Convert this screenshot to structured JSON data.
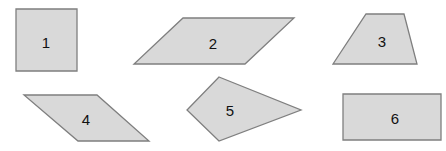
{
  "colors": {
    "fill": "#d9d9d9",
    "stroke": "#7f7f7f",
    "text": "#111111",
    "background": "#ffffff"
  },
  "shapes": [
    {
      "id": 1,
      "label": "1",
      "kind": "square",
      "points": "16,9 77,9 77,71 16,71",
      "label_pos": [
        46,
        41
      ]
    },
    {
      "id": 2,
      "label": "2",
      "kind": "parallelogram",
      "points": "183,18 294,18 245,64 134,64",
      "label_pos": [
        213,
        42
      ]
    },
    {
      "id": 3,
      "label": "3",
      "kind": "trapezoid",
      "points": "366,14 404,14 417,64 333,64",
      "label_pos": [
        382,
        40
      ]
    },
    {
      "id": 4,
      "label": "4",
      "kind": "parallelogram",
      "points": "24,95 97,95 149,141 78,141",
      "label_pos": [
        86,
        118
      ]
    },
    {
      "id": 5,
      "label": "5",
      "kind": "kite",
      "points": "219,77 301,110 219,141 187,110",
      "label_pos": [
        230,
        109
      ]
    },
    {
      "id": 6,
      "label": "6",
      "kind": "rectangle",
      "points": "343,94 441,94 441,140 343,140",
      "label_pos": [
        395,
        117
      ]
    }
  ]
}
